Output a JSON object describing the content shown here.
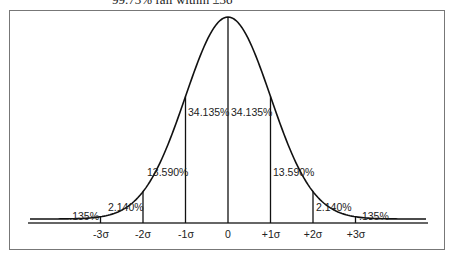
{
  "caption": "99.73% fall within ±3σ",
  "chart_data": {
    "type": "area",
    "xlabel": "",
    "ylabel": "",
    "x_ticks": [
      "-3σ",
      "-2σ",
      "-1σ",
      "0",
      "+1σ",
      "+2σ",
      "+3σ"
    ],
    "segments": [
      {
        "range": "< -3σ",
        "percent": ".135%"
      },
      {
        "range": "-3σ to -2σ",
        "percent": "2.140%"
      },
      {
        "range": "-2σ to -1σ",
        "percent": "13.590%"
      },
      {
        "range": "-1σ to 0",
        "percent": "34.135%"
      },
      {
        "range": "0 to +1σ",
        "percent": "34.135%"
      },
      {
        "range": "+1σ to +2σ",
        "percent": "13.590%"
      },
      {
        "range": "+2σ to +3σ",
        "percent": "2.140%"
      },
      {
        "range": "> +3σ",
        "percent": ".135%"
      }
    ],
    "grid": false,
    "legend": "none"
  },
  "labels": {
    "ticks": [
      "-3σ",
      "-2σ",
      "-1σ",
      "0",
      "+1σ",
      "+2σ",
      "+3σ"
    ],
    "pct": [
      ".135%",
      "2.140%",
      "13.590%",
      "34.135%",
      "34.135%",
      "13.590%",
      "2.140%",
      ".135%"
    ]
  }
}
